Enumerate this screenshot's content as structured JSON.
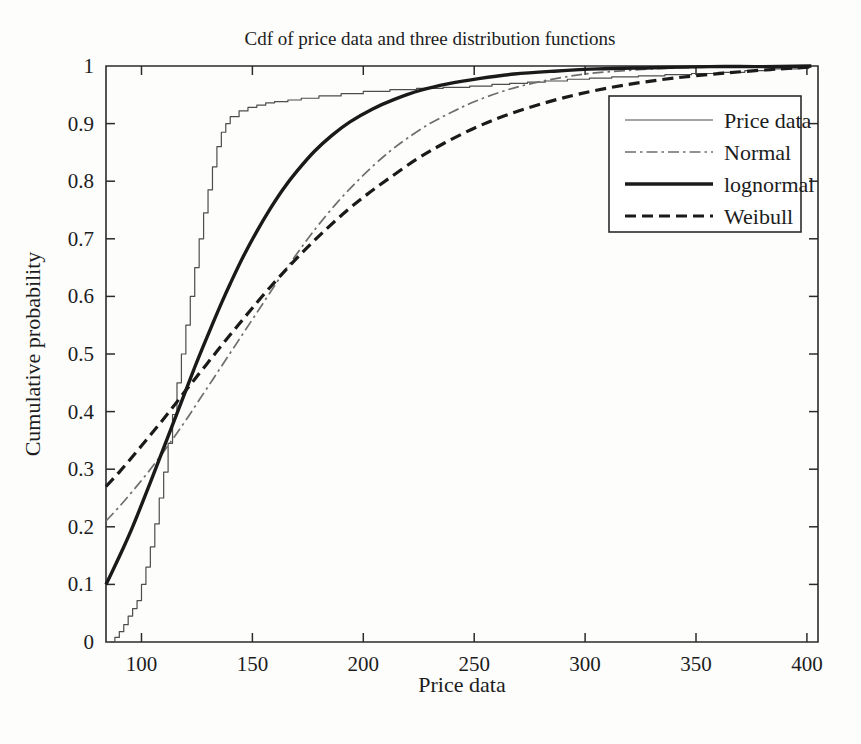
{
  "figure": {
    "title": "Cdf of price data and three distribution functions",
    "background_color": "#fdfdfc",
    "foreground_color": "#1c1c1c"
  },
  "axes": {
    "x_title": "Price data",
    "y_title": "Cumulative probability",
    "x_ticks": [
      "100",
      "150",
      "200",
      "250",
      "300",
      "350",
      "400"
    ],
    "y_ticks": [
      "0",
      "0.1",
      "0.2",
      "0.3",
      "0.4",
      "0.5",
      "0.6",
      "0.7",
      "0.8",
      "0.9",
      "1"
    ]
  },
  "legend": {
    "position": "right-upper",
    "entries": [
      {
        "label": "Price data",
        "style": "solid-thin",
        "color": "#4d4d4d"
      },
      {
        "label": "Normal",
        "style": "dash-dot",
        "color": "#6e6e6e"
      },
      {
        "label": "lognormal",
        "style": "solid-thick",
        "color": "#1a1a1a"
      },
      {
        "label": "Weibull",
        "style": "dashed",
        "color": "#1a1a1a"
      }
    ]
  },
  "chart_data": {
    "type": "line",
    "title": "Cdf of price data and three distribution functions",
    "xlabel": "Price data",
    "ylabel": "Cumulative probability",
    "xlim": [
      84,
      405
    ],
    "ylim": [
      0,
      1
    ],
    "xticks": [
      100,
      150,
      200,
      250,
      300,
      350,
      400
    ],
    "yticks": [
      0,
      0.1,
      0.2,
      0.3,
      0.4,
      0.5,
      0.6,
      0.7,
      0.8,
      0.9,
      1
    ],
    "grid": false,
    "legend_position": "upper right",
    "series": [
      {
        "name": "Price data",
        "style": "solid-thin",
        "color": "#4d4d4d",
        "note": "empirical step CDF of the observed price sample",
        "x": [
          86,
          88,
          90,
          92,
          94,
          96,
          98,
          100,
          102,
          104,
          106,
          108,
          110,
          112,
          114,
          116,
          118,
          120,
          122,
          124,
          126,
          128,
          130,
          132,
          134,
          136,
          138,
          140,
          144,
          148,
          152,
          156,
          160,
          166,
          172,
          180,
          190,
          200,
          212,
          224,
          236,
          248,
          258,
          266,
          274,
          282,
          292,
          302,
          312,
          324,
          336,
          348,
          360,
          372,
          384,
          396,
          402
        ],
        "y": [
          0.0,
          0.008,
          0.018,
          0.03,
          0.045,
          0.058,
          0.072,
          0.1,
          0.13,
          0.165,
          0.205,
          0.25,
          0.295,
          0.345,
          0.395,
          0.45,
          0.5,
          0.55,
          0.6,
          0.65,
          0.7,
          0.745,
          0.785,
          0.825,
          0.86,
          0.885,
          0.9,
          0.912,
          0.922,
          0.928,
          0.932,
          0.936,
          0.938,
          0.941,
          0.944,
          0.948,
          0.952,
          0.956,
          0.959,
          0.961,
          0.963,
          0.965,
          0.968,
          0.97,
          0.972,
          0.974,
          0.977,
          0.979,
          0.981,
          0.983,
          0.985,
          0.987,
          0.989,
          0.992,
          0.995,
          0.999,
          1.0
        ]
      },
      {
        "name": "Normal",
        "style": "dash-dot",
        "color": "#6e6e6e",
        "note": "fitted normal distribution CDF",
        "x": [
          84,
          90,
          96,
          102,
          108,
          114,
          120,
          126,
          132,
          138,
          144,
          150,
          156,
          162,
          168,
          174,
          180,
          188,
          196,
          204,
          212,
          220,
          230,
          240,
          250,
          262,
          274,
          288,
          302,
          318,
          336,
          356,
          378,
          402
        ],
        "y": [
          0.21,
          0.235,
          0.262,
          0.29,
          0.32,
          0.352,
          0.385,
          0.42,
          0.455,
          0.49,
          0.525,
          0.56,
          0.595,
          0.63,
          0.663,
          0.695,
          0.725,
          0.762,
          0.795,
          0.825,
          0.852,
          0.875,
          0.9,
          0.92,
          0.938,
          0.955,
          0.968,
          0.979,
          0.987,
          0.992,
          0.996,
          0.998,
          0.999,
          1.0
        ]
      },
      {
        "name": "lognormal",
        "style": "solid-thick",
        "color": "#1a1a1a",
        "note": "fitted lognormal distribution CDF",
        "x": [
          84,
          88,
          92,
          96,
          100,
          104,
          108,
          112,
          116,
          120,
          124,
          128,
          132,
          136,
          140,
          146,
          152,
          158,
          164,
          170,
          178,
          186,
          194,
          204,
          214,
          226,
          238,
          252,
          268,
          286,
          306,
          330,
          356,
          380,
          402
        ],
        "y": [
          0.1,
          0.132,
          0.165,
          0.2,
          0.238,
          0.277,
          0.317,
          0.357,
          0.397,
          0.437,
          0.477,
          0.515,
          0.552,
          0.588,
          0.622,
          0.67,
          0.713,
          0.752,
          0.787,
          0.817,
          0.852,
          0.88,
          0.903,
          0.925,
          0.942,
          0.958,
          0.969,
          0.978,
          0.986,
          0.991,
          0.995,
          0.997,
          0.999,
          0.999,
          1.0
        ]
      },
      {
        "name": "Weibull",
        "style": "dashed",
        "color": "#1a1a1a",
        "note": "fitted Weibull distribution CDF",
        "x": [
          84,
          90,
          96,
          102,
          108,
          114,
          120,
          126,
          132,
          138,
          144,
          150,
          158,
          166,
          174,
          182,
          192,
          202,
          212,
          224,
          236,
          250,
          264,
          280,
          298,
          318,
          340,
          364,
          388,
          402
        ],
        "y": [
          0.27,
          0.295,
          0.322,
          0.35,
          0.378,
          0.407,
          0.437,
          0.466,
          0.495,
          0.524,
          0.552,
          0.58,
          0.616,
          0.65,
          0.682,
          0.712,
          0.747,
          0.778,
          0.806,
          0.838,
          0.865,
          0.892,
          0.914,
          0.934,
          0.952,
          0.967,
          0.979,
          0.988,
          0.995,
          0.998
        ]
      }
    ]
  }
}
